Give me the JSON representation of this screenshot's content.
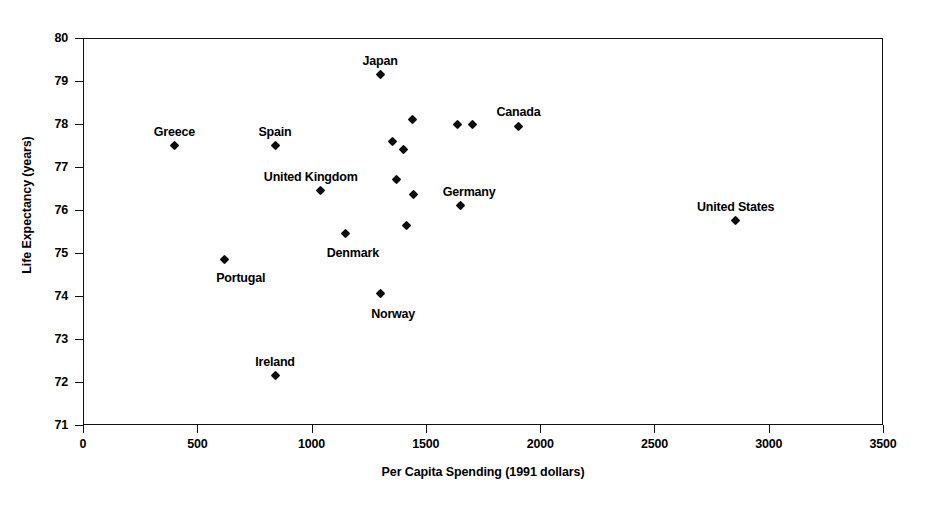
{
  "chart_data": {
    "type": "scatter",
    "title": "",
    "xlabel": "Per Capita Spending (1991 dollars)",
    "ylabel": "Life Expectancy (years)",
    "xlim": [
      0,
      3500
    ],
    "ylim": [
      71,
      80
    ],
    "xticks": [
      0,
      500,
      1000,
      1500,
      2000,
      2500,
      3000,
      3500
    ],
    "yticks": [
      71,
      72,
      73,
      74,
      75,
      76,
      77,
      78,
      79,
      80
    ],
    "xtick_labels": [
      "0",
      "500",
      "1000",
      "1500",
      "2000",
      "2500",
      "3000",
      "3500"
    ],
    "ytick_labels": [
      "71",
      "72",
      "73",
      "74",
      "75",
      "76",
      "77",
      "78",
      "79",
      "80"
    ],
    "grid": false,
    "legend": "none",
    "marker_style": "filled-diamond",
    "marker_color": "#0d0d0d",
    "frame_color": "#111111",
    "background_color": "#ffffff",
    "points": [
      {
        "label": "Greece",
        "x": 400,
        "y": 77.5,
        "label_dx": 0,
        "label_dy": -14,
        "label_anchor": "center"
      },
      {
        "label": "Portugal",
        "x": 620,
        "y": 74.85,
        "label_dx": 16,
        "label_dy": 19,
        "label_anchor": "center"
      },
      {
        "label": "Ireland",
        "x": 840,
        "y": 72.15,
        "label_dx": 0,
        "label_dy": -14,
        "label_anchor": "center"
      },
      {
        "label": "Spain",
        "x": 840,
        "y": 77.5,
        "label_dx": 0,
        "label_dy": -14,
        "label_anchor": "center"
      },
      {
        "label": "United Kingdom",
        "x": 1040,
        "y": 76.45,
        "label_dx": -10,
        "label_dy": -14,
        "label_anchor": "center"
      },
      {
        "label": "Denmark",
        "x": 1150,
        "y": 75.45,
        "label_dx": 7,
        "label_dy": 19,
        "label_anchor": "center"
      },
      {
        "label": "Japan",
        "x": 1300,
        "y": 79.15,
        "label_dx": 0,
        "label_dy": -14,
        "label_anchor": "center"
      },
      {
        "label": "Norway",
        "x": 1300,
        "y": 74.05,
        "label_dx": 13,
        "label_dy": 20,
        "label_anchor": "center"
      },
      {
        "label": "",
        "x": 1355,
        "y": 77.6,
        "label_dx": 0,
        "label_dy": 0,
        "label_anchor": "center"
      },
      {
        "label": "",
        "x": 1370,
        "y": 76.7,
        "label_dx": 0,
        "label_dy": 0,
        "label_anchor": "center"
      },
      {
        "label": "",
        "x": 1400,
        "y": 77.4,
        "label_dx": 0,
        "label_dy": 0,
        "label_anchor": "center"
      },
      {
        "label": "",
        "x": 1415,
        "y": 75.65,
        "label_dx": 0,
        "label_dy": 0,
        "label_anchor": "center"
      },
      {
        "label": "",
        "x": 1440,
        "y": 78.1,
        "label_dx": 0,
        "label_dy": 0,
        "label_anchor": "center"
      },
      {
        "label": "",
        "x": 1445,
        "y": 76.35,
        "label_dx": 0,
        "label_dy": 0,
        "label_anchor": "center"
      },
      {
        "label": "Germany",
        "x": 1650,
        "y": 76.1,
        "label_dx": 9,
        "label_dy": -14,
        "label_anchor": "center"
      },
      {
        "label": "",
        "x": 1640,
        "y": 78.0,
        "label_dx": 0,
        "label_dy": 0,
        "label_anchor": "center"
      },
      {
        "label": "",
        "x": 1705,
        "y": 78.0,
        "label_dx": 0,
        "label_dy": 0,
        "label_anchor": "center"
      },
      {
        "label": "Canada",
        "x": 1905,
        "y": 77.95,
        "label_dx": 0,
        "label_dy": -14,
        "label_anchor": "center"
      },
      {
        "label": "United States",
        "x": 2855,
        "y": 75.75,
        "label_dx": 0,
        "label_dy": -14,
        "label_anchor": "center"
      }
    ]
  }
}
